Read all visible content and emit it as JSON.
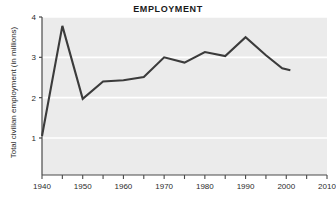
{
  "chart_data": {
    "type": "line",
    "title": "EMPLOYMENT",
    "xlabel": "",
    "ylabel": "Total civilian employment (in millions)",
    "xlim": [
      1940,
      2010
    ],
    "ylim": [
      0,
      4
    ],
    "xticks": [
      1940,
      1945,
      1950,
      1955,
      1960,
      1965,
      1970,
      1975,
      1980,
      1985,
      1990,
      1995,
      2000,
      2005,
      2010
    ],
    "xtick_labels": [
      "1940",
      "",
      "1950",
      "",
      "1960",
      "",
      "1970",
      "",
      "1980",
      "",
      "1990",
      "",
      "2000",
      "",
      "2010"
    ],
    "yticks": [
      1,
      2,
      3,
      4
    ],
    "ytick_labels": [
      "1",
      "2",
      "3",
      "4"
    ],
    "grid": "horizontal-white",
    "legend": "none",
    "plot_bg": "#ebebeb",
    "line_color": "#3b3b3b",
    "x": [
      1940,
      1945,
      1950,
      1955,
      1960,
      1965,
      1970,
      1975,
      1980,
      1985,
      1990,
      1995,
      1999,
      2001
    ],
    "values": [
      1.05,
      3.78,
      1.97,
      2.4,
      2.43,
      2.51,
      3.0,
      2.87,
      3.13,
      3.03,
      3.5,
      3.05,
      2.73,
      2.68
    ],
    "series": [
      {
        "name": "Total civilian employment",
        "values": [
          1.05,
          3.78,
          1.97,
          2.4,
          2.43,
          2.51,
          3.0,
          2.87,
          3.13,
          3.03,
          3.5,
          3.05,
          2.73,
          2.68
        ]
      }
    ]
  },
  "axis": {
    "y_title": "Total civilian employment (in millions)",
    "y_labels": [
      "4",
      "3",
      "2",
      "1"
    ],
    "x_labels": [
      "1940",
      "1950",
      "1960",
      "1970",
      "1980",
      "1990",
      "2000",
      "2010"
    ]
  },
  "header": {
    "title": "EMPLOYMENT"
  }
}
